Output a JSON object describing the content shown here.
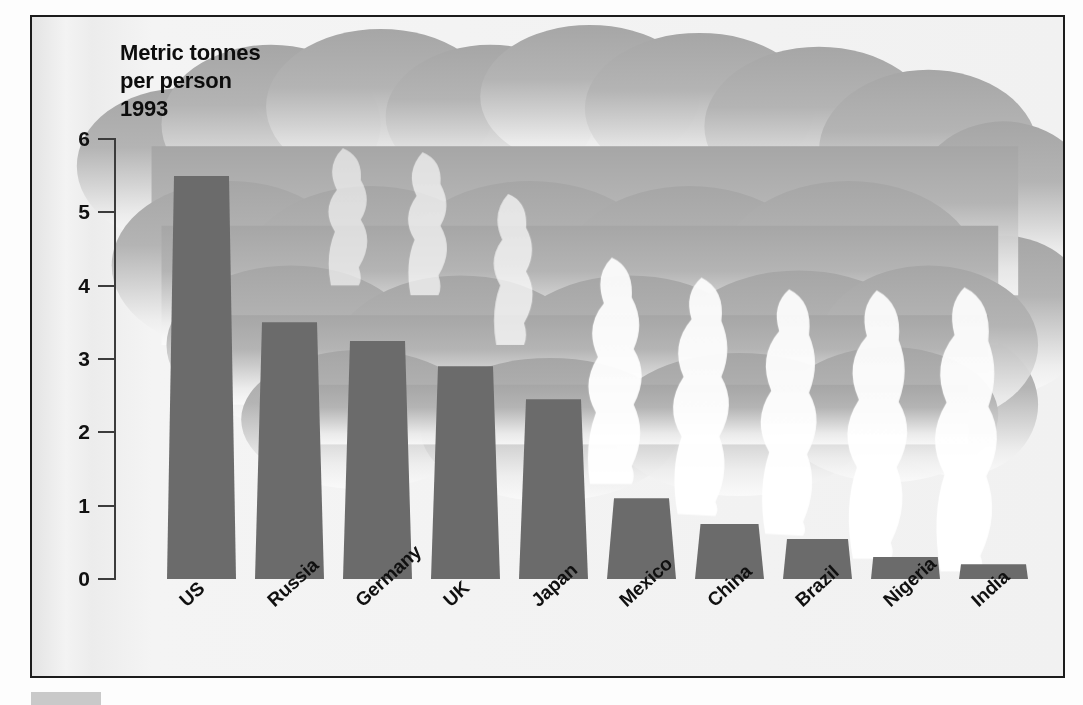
{
  "figure": {
    "title": "Metric tonnes\nper person\n1993",
    "bar_color": "#6b6b6b",
    "smoke_color": "#a8a8a8",
    "frame_color": "#1c1c1c",
    "background_color": "#efefef",
    "caption_swatch": "colour-key-swatch"
  },
  "chart_data": {
    "type": "bar",
    "title": "Metric tonnes per person 1993",
    "subtitle": "",
    "xlabel": "",
    "ylabel": "Metric tonnes per person",
    "ylim": [
      0,
      6
    ],
    "yticks": [
      0,
      1,
      2,
      3,
      4,
      5,
      6
    ],
    "ytick_labels": [
      "0",
      "1",
      "2",
      "3",
      "4",
      "5",
      "6"
    ],
    "grid": false,
    "legend": null,
    "categories": [
      "US",
      "Russia",
      "Germany",
      "UK",
      "Japan",
      "Mexico",
      "China",
      "Brazil",
      "Nigeria",
      "India"
    ],
    "values": [
      5.5,
      3.5,
      3.25,
      2.9,
      2.45,
      1.1,
      0.75,
      0.55,
      0.3,
      0.2
    ],
    "annotations": [
      "Smokestack-style bars emitting a grey smoke cloud across the top of the chart"
    ]
  }
}
